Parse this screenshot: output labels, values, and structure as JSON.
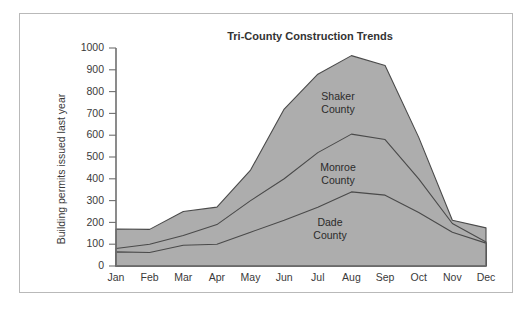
{
  "figure": {
    "frame_color": "#b9b9b9",
    "background_color": "#ffffff"
  },
  "chart_data": {
    "type": "area",
    "stacked": true,
    "title": "Tri-County Construction Trends",
    "xlabel": "",
    "ylabel": "Building permits issued last year",
    "categories": [
      "Jan",
      "Feb",
      "Mar",
      "Apr",
      "May",
      "Jun",
      "Jul",
      "Aug",
      "Sep",
      "Oct",
      "Nov",
      "Dec"
    ],
    "ylim": [
      0,
      1000
    ],
    "ytick_labels": [
      "0",
      "100",
      "200",
      "300",
      "400",
      "500",
      "600",
      "700",
      "800",
      "900",
      "1000"
    ],
    "ytick_values": [
      0,
      100,
      200,
      300,
      400,
      500,
      600,
      700,
      800,
      900,
      1000
    ],
    "grid": false,
    "legend_position": "inline-annotations",
    "fill_color": "#adadad",
    "line_color": "#4a4a4a",
    "series": [
      {
        "name": "Dade County",
        "label_lines": [
          "Dade",
          "County"
        ],
        "values": [
          65,
          62,
          95,
          100,
          155,
          210,
          270,
          340,
          325,
          245,
          155,
          105
        ],
        "cumulative": [
          65,
          62,
          95,
          100,
          155,
          210,
          270,
          340,
          325,
          245,
          155,
          105
        ]
      },
      {
        "name": "Monroe County",
        "label_lines": [
          "Monroe",
          "County"
        ],
        "values": [
          15,
          38,
          45,
          90,
          145,
          190,
          250,
          265,
          255,
          155,
          40,
          5
        ],
        "cumulative": [
          80,
          100,
          140,
          190,
          300,
          400,
          520,
          605,
          580,
          400,
          195,
          110
        ]
      },
      {
        "name": "Shaker County",
        "label_lines": [
          "Shaker",
          "County"
        ],
        "values": [
          90,
          68,
          110,
          80,
          140,
          320,
          360,
          360,
          340,
          190,
          15,
          65
        ],
        "cumulative": [
          170,
          168,
          250,
          270,
          440,
          720,
          880,
          965,
          920,
          590,
          210,
          175
        ]
      }
    ],
    "annotations": [
      {
        "name": "shaker-county-label",
        "lines": [
          "Shaker",
          "County"
        ]
      },
      {
        "name": "monroe-county-label",
        "lines": [
          "Monroe",
          "County"
        ]
      },
      {
        "name": "dade-county-label",
        "lines": [
          "Dade",
          "County"
        ]
      }
    ]
  }
}
